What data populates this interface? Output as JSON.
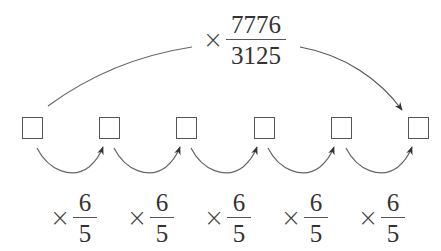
{
  "diagram": {
    "boxes": [
      {
        "id": 1,
        "value": ""
      },
      {
        "id": 2,
        "value": ""
      },
      {
        "id": 3,
        "value": ""
      },
      {
        "id": 4,
        "value": ""
      },
      {
        "id": 5,
        "value": ""
      },
      {
        "id": 6,
        "value": ""
      }
    ],
    "top_arrow": {
      "from": 1,
      "to": 6,
      "operator": "×",
      "numerator": "7776",
      "denominator": "3125"
    },
    "step_arrows": [
      {
        "from": 1,
        "to": 2,
        "operator": "×",
        "numerator": "6",
        "denominator": "5"
      },
      {
        "from": 2,
        "to": 3,
        "operator": "×",
        "numerator": "6",
        "denominator": "5"
      },
      {
        "from": 3,
        "to": 4,
        "operator": "×",
        "numerator": "6",
        "denominator": "5"
      },
      {
        "from": 4,
        "to": 5,
        "operator": "×",
        "numerator": "6",
        "denominator": "5"
      },
      {
        "from": 5,
        "to": 6,
        "operator": "×",
        "numerator": "6",
        "denominator": "5"
      }
    ],
    "colors": {
      "stroke": "#555555",
      "text": "#333333",
      "background": "#ffffff"
    }
  }
}
